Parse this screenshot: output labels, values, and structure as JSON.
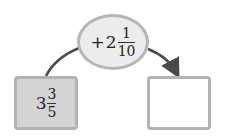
{
  "operation": {
    "sign": "+",
    "whole": "2",
    "numerator": "1",
    "denominator": "10"
  },
  "start_value": {
    "whole": "3",
    "numerator": "3",
    "denominator": "5"
  },
  "result_value": {
    "whole": "",
    "numerator": "",
    "denominator": ""
  },
  "colors": {
    "ellipse_fill": "#ececec",
    "border": "#b5b5b5",
    "start_box_fill": "#d4d4d4",
    "result_box_fill": "#ffffff",
    "arrow": "#4a4a4a"
  }
}
